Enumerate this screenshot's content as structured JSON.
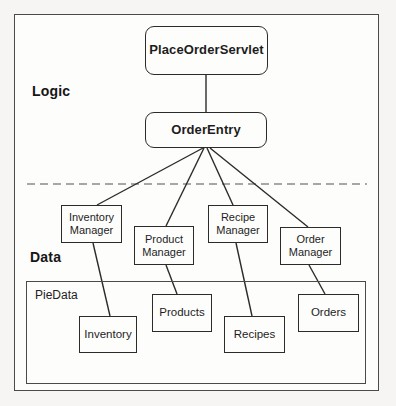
{
  "labels": {
    "logic": "Logic",
    "data": "Data",
    "piedata": "PieData"
  },
  "nodes": {
    "place_order_servlet": "PlaceOrderServlet",
    "order_entry": "OrderEntry",
    "inventory_manager": "Inventory Manager",
    "product_manager": "Product Manager",
    "recipe_manager": "Recipe Manager",
    "order_manager": "Order Manager",
    "inventory": "Inventory",
    "products": "Products",
    "recipes": "Recipes",
    "orders": "Orders"
  },
  "edges": [
    {
      "from": "PlaceOrderServlet",
      "to": "OrderEntry"
    },
    {
      "from": "OrderEntry",
      "to": "Inventory Manager"
    },
    {
      "from": "OrderEntry",
      "to": "Product Manager"
    },
    {
      "from": "OrderEntry",
      "to": "Recipe Manager"
    },
    {
      "from": "OrderEntry",
      "to": "Order Manager"
    },
    {
      "from": "Inventory Manager",
      "to": "Inventory"
    },
    {
      "from": "Product Manager",
      "to": "Products"
    },
    {
      "from": "Recipe Manager",
      "to": "Recipes"
    },
    {
      "from": "Order Manager",
      "to": "Orders"
    }
  ],
  "colors": {
    "line": "#2b2b2b",
    "dashed_divider": "#8a8a8a",
    "box_border": "#2b2b2b",
    "frame_border": "#4a4a4a",
    "background": "#f6f5f3"
  }
}
